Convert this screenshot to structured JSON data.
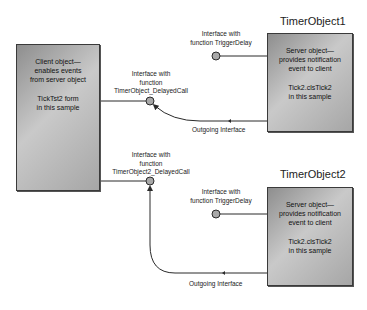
{
  "client": {
    "line1": "Client object—",
    "line2": "enables events",
    "line3": "from server object",
    "line4": "TickTst2 form",
    "line5": "in this sample"
  },
  "servers": [
    {
      "title": "TimerObject1",
      "line1": "Server object—",
      "line2": "provides notification",
      "line3": "event to client",
      "line4": "Tick2.clsTick2",
      "line5": "in this sample",
      "trigger_label_1": "Interface with",
      "trigger_label_2": "function TriggerDelay",
      "outgoing_label": "Outgoing Interface"
    },
    {
      "title": "TimerObject2",
      "line1": "Server object—",
      "line2": "provides notification",
      "line3": "event to client",
      "line4": "Tick2.clsTick2",
      "line5": "in this sample",
      "trigger_label_1": "Interface with",
      "trigger_label_2": "function TriggerDelay",
      "outgoing_label": "Outgoing Interface"
    }
  ],
  "client_interfaces": [
    {
      "line1": "Interface with",
      "line2": "function",
      "line3": "TimerObject_DelayedCall"
    },
    {
      "line1": "Interface with",
      "line2": "function",
      "line3": "TimerObject2_DelayedCall"
    }
  ],
  "colors": {
    "box_fill": "#b0b0b0",
    "line": "#2a2a2a",
    "interface_circle": "#a8a8a8"
  }
}
